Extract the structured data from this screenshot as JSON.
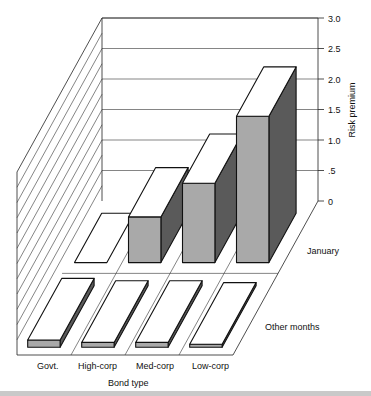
{
  "chart_data": {
    "type": "bar",
    "subtype": "3d-grouped",
    "title": "",
    "categories": [
      "Govt.",
      "High-corp",
      "Med-corp",
      "Low-corp"
    ],
    "series": [
      {
        "name": "January",
        "values": [
          0.0,
          0.75,
          1.3,
          2.4
        ]
      },
      {
        "name": "Other months",
        "values": [
          0.12,
          0.08,
          0.08,
          0.05
        ]
      }
    ],
    "xlabel": "Bond type",
    "ylabel": "Risk premium",
    "ylim": [
      0,
      3.0
    ],
    "yticks": [
      "0",
      ".5",
      "1.0",
      "1.5",
      "2.0",
      "2.5",
      "3.0"
    ],
    "grid": true,
    "legend": "row labels on right side"
  },
  "colors": {
    "front_face": "#a9a9a9",
    "side_face": "#5a5a5a",
    "top_face": "#ffffff",
    "line": "#111111",
    "band": "#c9c9c9"
  }
}
